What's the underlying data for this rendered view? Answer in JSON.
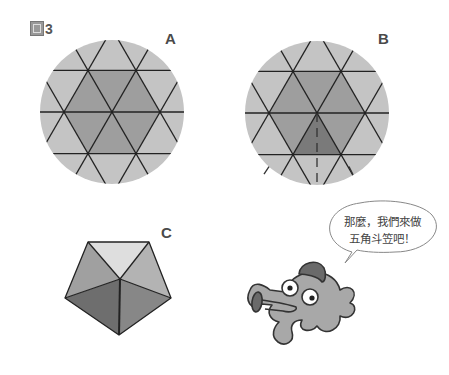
{
  "figure": {
    "label": "3",
    "label_prefix_glyph": "圖"
  },
  "panels": {
    "a": {
      "label": "A",
      "description": "circle divided into triangles with central hexagon shaded"
    },
    "b": {
      "label": "B",
      "description": "same circle, one lower triangle of hexagon darkened with dashed cut lines"
    },
    "c": {
      "label": "C",
      "description": "folded pentagonal cone (five-sided hat)"
    }
  },
  "speech_bubble": {
    "lines": [
      "那麼，我們來做",
      "五角斗笠吧！"
    ]
  },
  "colors": {
    "circle_fill": "#c4c4c4",
    "hexagon_fill": "#9e9e9e",
    "highlight_triangle": "#7a7a7a",
    "line": "#222222",
    "cone_light": "#dedede",
    "cone_mid": "#b3b3b3",
    "cone_gray": "#a0a0a0",
    "cone_dark": "#6e6e6e",
    "cone_darker": "#878787",
    "character_body": "#a8a8a8",
    "character_dark": "#6a6a6a"
  }
}
